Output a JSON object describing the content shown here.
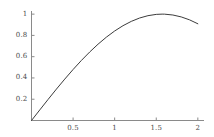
{
  "chart_data": {
    "type": "line",
    "title": "",
    "subtitle": "",
    "xlabel": "",
    "ylabel": "",
    "function": "sin(x)",
    "xlim": [
      0,
      2.05
    ],
    "ylim": [
      0,
      1.02
    ],
    "grid": false,
    "legend": null,
    "axis_color": "#8a8a8a",
    "curve_color": "#3c3c3c",
    "background_color": "#ffffff",
    "xticks": [
      {
        "value": 0.5,
        "label": "0.5"
      },
      {
        "value": 1,
        "label": "1"
      },
      {
        "value": 1.5,
        "label": "1.5"
      },
      {
        "value": 2,
        "label": "2"
      }
    ],
    "yticks": [
      {
        "value": 0.2,
        "label": "0.2"
      },
      {
        "value": 0.4,
        "label": "0.4"
      },
      {
        "value": 0.6,
        "label": "0.6"
      },
      {
        "value": 0.8,
        "label": "0.8"
      },
      {
        "value": 1,
        "label": "1"
      }
    ],
    "x": [
      0,
      0.1,
      0.2,
      0.3,
      0.4,
      0.5,
      0.6,
      0.7,
      0.8,
      0.9,
      1,
      1.1,
      1.2,
      1.3,
      1.4,
      1.5,
      1.5708,
      1.6,
      1.7,
      1.8,
      1.9,
      2
    ],
    "values": [
      0,
      0.0998,
      0.1987,
      0.2955,
      0.3894,
      0.4794,
      0.5646,
      0.6442,
      0.7174,
      0.7833,
      0.8415,
      0.8912,
      0.932,
      0.9636,
      0.9854,
      0.9975,
      1,
      0.9996,
      0.9917,
      0.9738,
      0.9463,
      0.9093
    ]
  }
}
